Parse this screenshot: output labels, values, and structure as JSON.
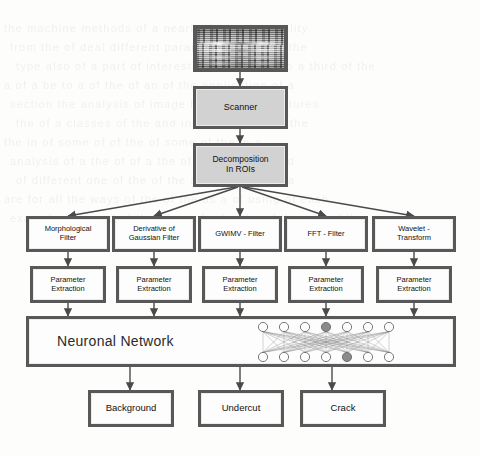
{
  "diagram": {
    "type": "flowchart",
    "colors": {
      "box_fill": "#d2d2d2",
      "box_border": "#585858",
      "box_white_fill": "#fdfdfd",
      "arrow": "#4a4a4a",
      "page_background": "#fdfdfc",
      "node_highlight": "#8a8a8a"
    },
    "source_image": {
      "label": "radiographic-weld-image",
      "description": "grayscale scanned weld radiograph"
    },
    "nodes": {
      "scanner": "Scanner",
      "decomposition": "Decomposition\nIn ROIs",
      "decomposition_line1": "Decomposition",
      "decomposition_line2": "In ROIs",
      "neural_network": "Neuronal Network"
    },
    "filters": [
      {
        "line1": "Morphological",
        "line2": "Filter"
      },
      {
        "line1": "Derivative of",
        "line2": "Gaussian Filter"
      },
      {
        "line1": "GWIMV - Filter",
        "line2": ""
      },
      {
        "line1": "FFT - Filter",
        "line2": ""
      },
      {
        "line1": "Wavelet -",
        "line2": "Transform"
      }
    ],
    "parameter_extraction": [
      {
        "line1": "Parameter",
        "line2": "Extraction"
      },
      {
        "line1": "Parameter",
        "line2": "Extraction"
      },
      {
        "line1": "Parameter",
        "line2": "Extraction"
      },
      {
        "line1": "Parameter",
        "line2": "Extraction"
      },
      {
        "line1": "Parameter",
        "line2": "Extraction"
      }
    ],
    "outputs": [
      {
        "label": "Background"
      },
      {
        "label": "Undercut"
      },
      {
        "label": "Crack"
      }
    ],
    "network_glyph": {
      "rows": 2,
      "nodes_per_row": 7,
      "highlighted_top_index": 3,
      "highlighted_bottom_index": 4
    },
    "ghost_text": [
      "the machine  methods of  a nearly  the  ... the  quality",
      "from  the  of  deal  different  parameters  of  as  by  the",
      "type  also  of  a  part  of  interest  of  the  second  to  a  third  of  the",
      "a  of  a  be  to  a  of  the  of  an  of  the  application  of  a",
      "section  the  analysis  of  image  by  of  a  the  structures",
      "the  of  a  classes  of  the  and  in  of  the  of  the  of  the",
      "the  in  of  some  of  of  the  of  some  of  the  in  a",
      "analysis  of  a  the  of  of  a  the  of  a  and  of  the  and",
      "of  different  one  of  the  of  the  and  for  a  the  of  a",
      "are  for  all  the  ways  of  the  of  the  as  a  of  using  of  each",
      "examples  the  and  of  the  of  an  of  a  for  the  of  the  and  of  the"
    ]
  }
}
